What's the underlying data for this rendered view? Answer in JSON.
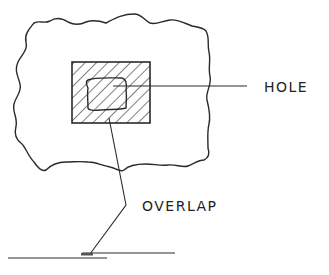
{
  "diagram": {
    "type": "technical-sketch",
    "labels": {
      "hole": "HOLE",
      "overlap": "OVERLAP"
    },
    "colors": {
      "line": "#2a2a2a",
      "background": "#ffffff"
    },
    "elements": [
      {
        "id": "outer-surface",
        "shape": "irregular-blob"
      },
      {
        "id": "patch",
        "shape": "rectangle",
        "fill": "diagonal-hatch"
      },
      {
        "id": "hole",
        "shape": "rounded-irregular-rectangle"
      },
      {
        "id": "hole-leader",
        "target": "hole",
        "label": "HOLE"
      },
      {
        "id": "overlap-leader",
        "target": "patch",
        "label": "OVERLAP"
      },
      {
        "id": "base-lines",
        "shape": "two offset horizontal lines (overlapping joint)"
      }
    ]
  }
}
